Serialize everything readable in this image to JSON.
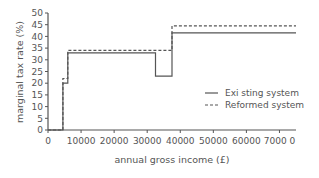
{
  "chart_data": {
    "type": "line",
    "step": true,
    "title": "",
    "xlabel": "annual gross income (£)",
    "ylabel": "marginal tax rate (%)",
    "xlim": [
      0,
      75000
    ],
    "ylim": [
      0,
      50
    ],
    "xticks": [
      0,
      10000,
      20000,
      30000,
      40000,
      50000,
      60000,
      70000
    ],
    "xtick_labels": [
      "0",
      "10000",
      "20000",
      "30000",
      "40000",
      "50000",
      "60000",
      "7000 0"
    ],
    "yticks": [
      0,
      5,
      10,
      15,
      20,
      25,
      30,
      35,
      40,
      45,
      50
    ],
    "ytick_labels": [
      "0",
      "5",
      "10",
      "15",
      "20",
      "25",
      "30",
      "35",
      "40",
      "45",
      "50"
    ],
    "grid": false,
    "legend_position": "lower right",
    "series": [
      {
        "name": "Exi sting system",
        "style": "solid",
        "x": [
          0,
          4500,
          4500,
          6000,
          6000,
          32500,
          32500,
          37500,
          37500,
          75000
        ],
        "y": [
          0,
          0,
          20,
          20,
          33,
          33,
          23,
          23,
          41.5,
          41.5
        ]
      },
      {
        "name": "Reformed system",
        "style": "dashed",
        "x": [
          0,
          4500,
          4500,
          6000,
          6000,
          37500,
          37500,
          75000
        ],
        "y": [
          0,
          0,
          22,
          22,
          34,
          34,
          44.5,
          44.5
        ]
      }
    ]
  },
  "labels": {
    "xlabel": "annual gross income (£)",
    "ylabel": "marginal tax rate (%)",
    "legend_existing": "Exi sting system",
    "legend_reformed": "Reformed system"
  }
}
